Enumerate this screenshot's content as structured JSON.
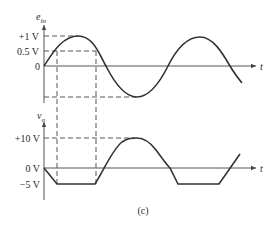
{
  "figure": {
    "caption": "(c)",
    "input_plot": {
      "ylabel_main": "e",
      "ylabel_sub": "in",
      "xlabel": "t",
      "ticks": [
        "+1 V",
        "0.5 V",
        "0"
      ],
      "signal": "sine",
      "amplitude": "1 V"
    },
    "output_plot": {
      "ylabel_main": "v",
      "ylabel_sub": "o",
      "xlabel": "t",
      "ticks": [
        "+10 V",
        "0 V",
        "−5 V"
      ],
      "signal": "amplified sine clipped at -5 V",
      "max": "+10 V",
      "min": "−5 V"
    }
  },
  "colors": {
    "stroke": "#333333",
    "background": "#ffffff"
  }
}
